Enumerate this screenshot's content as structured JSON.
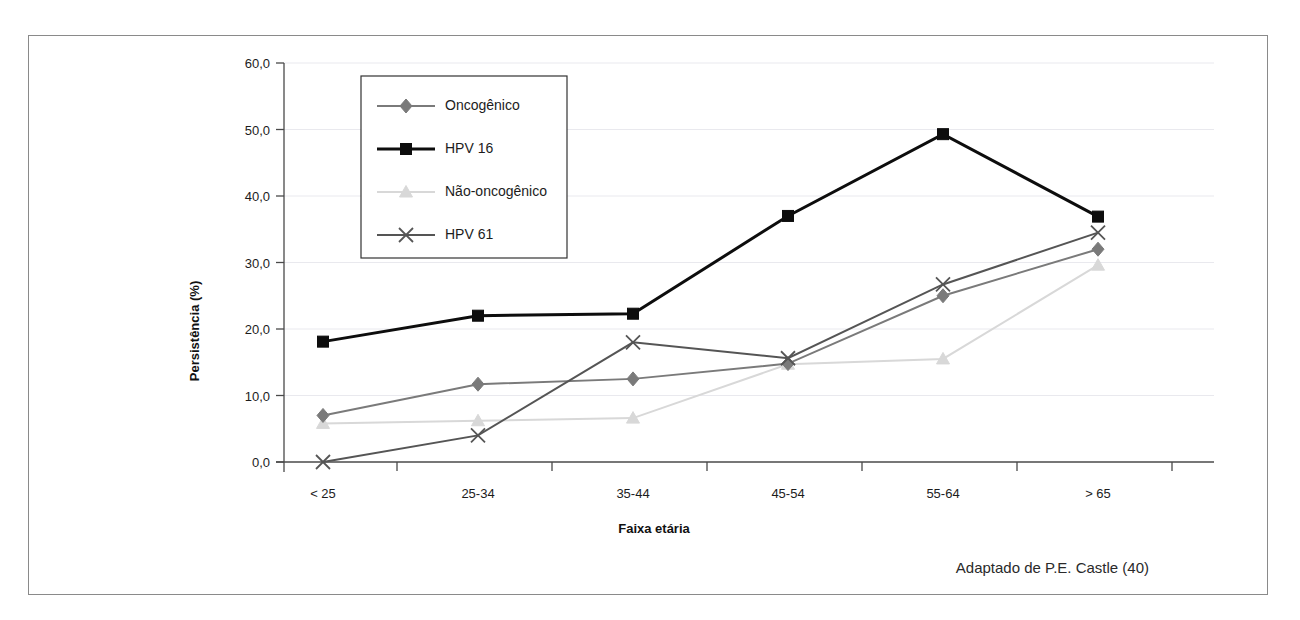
{
  "figure": {
    "source_note": "Adaptado de P.E. Castle (40)"
  },
  "chart_data": {
    "type": "line",
    "title": "",
    "subtitle": "",
    "xlabel": "Faixa etária",
    "ylabel": "Persistência (%)",
    "categories": [
      "< 25",
      "25-34",
      "35-44",
      "45-54",
      "55-64",
      "> 65"
    ],
    "ylim": [
      0,
      60
    ],
    "ytick_values": [
      0,
      10,
      20,
      30,
      40,
      50,
      60
    ],
    "ytick_labels": [
      "0,0",
      "10,0",
      "20,0",
      "30,0",
      "40,0",
      "50,0",
      "60,0"
    ],
    "grid": "horizontal",
    "legend_position": "top-left-inside",
    "series": [
      {
        "name": "Oncogênico",
        "color": "#7a7a7a",
        "marker": "diamond",
        "width": 2,
        "values": [
          7.0,
          11.7,
          12.5,
          14.8,
          25.0,
          32.0
        ]
      },
      {
        "name": "HPV 16",
        "color": "#0d0d0d",
        "marker": "square",
        "width": 3,
        "values": [
          18.1,
          22.0,
          22.3,
          37.0,
          49.3,
          36.9
        ]
      },
      {
        "name": "Não-oncogênico",
        "color": "#d8d8d8",
        "marker": "triangle",
        "width": 2,
        "values": [
          5.8,
          6.2,
          6.6,
          14.7,
          15.5,
          29.6
        ]
      },
      {
        "name": "HPV 61",
        "color": "#555555",
        "marker": "cross",
        "width": 2,
        "values": [
          0.0,
          4.0,
          18.0,
          15.6,
          26.7,
          34.5
        ]
      }
    ]
  }
}
